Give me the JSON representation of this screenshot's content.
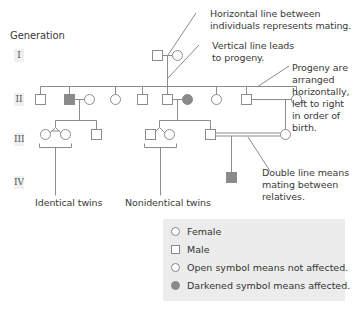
{
  "diagram": {
    "title": "Generation",
    "generations": [
      "I",
      "II",
      "III",
      "IV"
    ],
    "annotations": {
      "mating": "Horizontal line between\nindividuals represents mating.",
      "mating_line1": "Horizontal line between",
      "mating_line2": "individuals represents mating.",
      "progeny_line1": "Vertical line leads",
      "progeny_line2": "to progeny.",
      "order_line1": "Progeny are",
      "order_line2": "arranged",
      "order_line3": "horizontally,",
      "order_line4": "left to right",
      "order_line5": "in order of",
      "order_line6": "birth.",
      "double_line1": "Double line means",
      "double_line2": "mating between",
      "double_line3": "relatives.",
      "identical_twins": "Identical twins",
      "nonidentical_twins": "Nonidentical twins"
    },
    "individuals": {
      "gen_I": [
        {
          "sex": "male",
          "affected": false
        },
        {
          "sex": "female",
          "affected": false
        }
      ],
      "gen_II": [
        {
          "sex": "male",
          "affected": false
        },
        {
          "sex": "male",
          "affected": true,
          "mate": "female-unaffected"
        },
        {
          "sex": "female",
          "affected": false
        },
        {
          "sex": "female",
          "affected": false
        },
        {
          "sex": "male",
          "affected": false
        },
        {
          "sex": "male",
          "affected": false,
          "mate": "female-affected"
        },
        {
          "sex": "female",
          "affected": false
        },
        {
          "sex": "male",
          "affected": false,
          "mate": "female-unaffected"
        }
      ],
      "gen_III": [
        {
          "sex": "female",
          "affected": false,
          "twin": "identical"
        },
        {
          "sex": "female",
          "affected": false,
          "twin": "identical"
        },
        {
          "sex": "male",
          "affected": false
        },
        {
          "sex": "male",
          "affected": false,
          "twin": "nonidentical"
        },
        {
          "sex": "female",
          "affected": false,
          "twin": "nonidentical"
        },
        {
          "sex": "male",
          "affected": false,
          "consanguineous_mate": "female-unaffected"
        }
      ],
      "gen_IV": [
        {
          "sex": "male",
          "affected": true
        }
      ]
    },
    "colors": {
      "line": "#8c8c8c",
      "affected_fill": "#8a8a8a",
      "legend_bg": "#ececec",
      "text": "#3a3a3a"
    }
  },
  "legend": {
    "items": [
      {
        "symbol": "circle-open",
        "label": "Female"
      },
      {
        "symbol": "square-open",
        "label": "Male"
      },
      {
        "symbol": "circle-open",
        "label": "Open symbol means not affected."
      },
      {
        "symbol": "circle-filled",
        "label": "Darkened symbol means affected."
      }
    ]
  }
}
